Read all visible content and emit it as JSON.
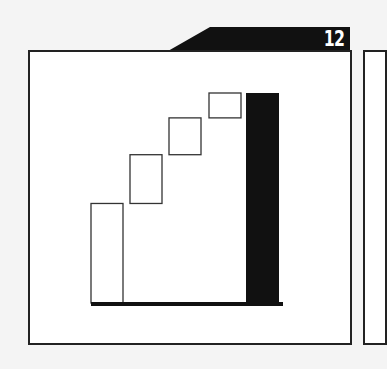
{
  "page": {
    "number": "12"
  },
  "colors": {
    "frame": "#222222",
    "total_bar": "#111111",
    "step_bar_fill": "#ffffff",
    "tab": "#111111"
  },
  "chart_data": {
    "type": "waterfall",
    "title": "",
    "xlabel": "",
    "ylabel": "",
    "categories": [
      "Start",
      "Step 1",
      "Step 2",
      "Step 3",
      "Total"
    ],
    "series": [
      {
        "name": "Increments",
        "values": [
          100,
          49,
          37,
          25,
          211
        ],
        "base": [
          0,
          100,
          149,
          186,
          0
        ]
      }
    ],
    "total_index": 4,
    "ylim": [
      0,
      211
    ],
    "grid": false,
    "legend": "none"
  }
}
